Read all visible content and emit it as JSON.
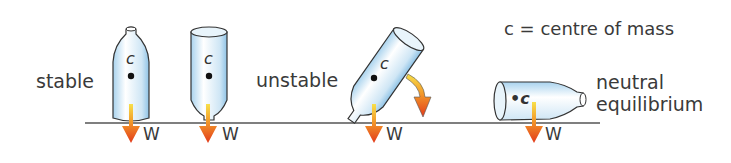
{
  "legend": {
    "text": "c = centre of mass"
  },
  "figures": [
    {
      "id": "stable",
      "label": "stable",
      "com_label": "c",
      "weight_label": "W"
    },
    {
      "id": "stable-inverted",
      "label": "",
      "com_label": "c",
      "weight_label": "W"
    },
    {
      "id": "unstable",
      "label": "unstable",
      "com_label": "c",
      "weight_label": "W"
    },
    {
      "id": "neutral",
      "label_line1": "neutral",
      "label_line2": "equilibrium",
      "com_label": "•c",
      "weight_label": "W"
    }
  ],
  "colors": {
    "ground": "#555555",
    "bottle_fill": "#d6ecf8",
    "bottle_stroke": "#333333",
    "arrow_top": "#f5d020",
    "arrow_bottom": "#e8401c"
  }
}
